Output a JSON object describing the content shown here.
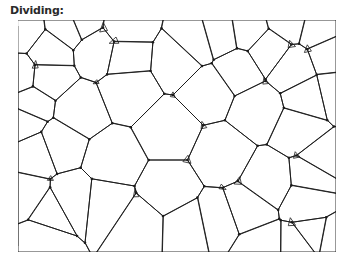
{
  "figure": {
    "title": "Dividing:",
    "line_color": "#1a1a1a",
    "background_color": "#ffffff"
  }
}
